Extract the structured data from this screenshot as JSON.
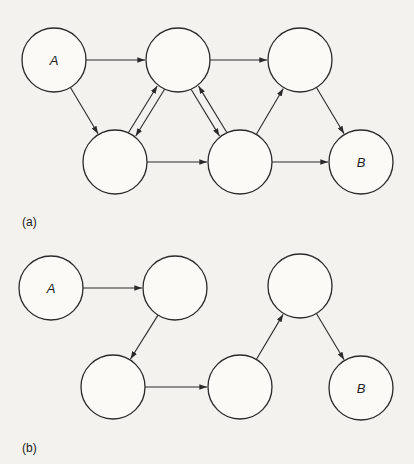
{
  "figure": {
    "panels": [
      {
        "id": "a",
        "caption": "(a)",
        "caption_pos": [
          22,
          226
        ],
        "nodes": [
          {
            "id": "A",
            "label": "A",
            "cx": 54,
            "cy": 60,
            "r": 32
          },
          {
            "id": "n2",
            "label": "",
            "cx": 178,
            "cy": 60,
            "r": 32
          },
          {
            "id": "n3",
            "label": "",
            "cx": 300,
            "cy": 60,
            "r": 32
          },
          {
            "id": "n4",
            "label": "",
            "cx": 115,
            "cy": 162,
            "r": 32
          },
          {
            "id": "n5",
            "label": "",
            "cx": 240,
            "cy": 162,
            "r": 32
          },
          {
            "id": "B",
            "label": "B",
            "cx": 361,
            "cy": 162,
            "r": 32
          }
        ],
        "edges": [
          {
            "from": "A",
            "to": "n2"
          },
          {
            "from": "n2",
            "to": "n3"
          },
          {
            "from": "A",
            "to": "n4"
          },
          {
            "from": "n4",
            "to": "n2",
            "offset": -4
          },
          {
            "from": "n2",
            "to": "n4",
            "offset": -4
          },
          {
            "from": "n2",
            "to": "n5",
            "offset": 4
          },
          {
            "from": "n5",
            "to": "n2",
            "offset": 4
          },
          {
            "from": "n5",
            "to": "n3"
          },
          {
            "from": "n3",
            "to": "B"
          },
          {
            "from": "n4",
            "to": "n5"
          },
          {
            "from": "n5",
            "to": "B"
          }
        ]
      },
      {
        "id": "b",
        "caption": "(b)",
        "caption_pos": [
          22,
          452
        ],
        "nodes": [
          {
            "id": "A",
            "label": "A",
            "cx": 51,
            "cy": 288,
            "r": 32
          },
          {
            "id": "n2",
            "label": "",
            "cx": 175,
            "cy": 288,
            "r": 32
          },
          {
            "id": "n3",
            "label": "",
            "cx": 300,
            "cy": 286,
            "r": 32
          },
          {
            "id": "n4",
            "label": "",
            "cx": 113,
            "cy": 387,
            "r": 32
          },
          {
            "id": "n5",
            "label": "",
            "cx": 240,
            "cy": 387,
            "r": 32
          },
          {
            "id": "B",
            "label": "B",
            "cx": 361,
            "cy": 388,
            "r": 32
          }
        ],
        "edges": [
          {
            "from": "A",
            "to": "n2"
          },
          {
            "from": "n2",
            "to": "n4"
          },
          {
            "from": "n4",
            "to": "n5"
          },
          {
            "from": "n5",
            "to": "n3"
          },
          {
            "from": "n3",
            "to": "B"
          }
        ]
      }
    ]
  }
}
